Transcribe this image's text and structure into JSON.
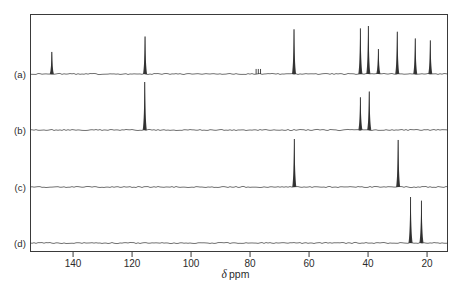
{
  "figure": {
    "type": "nmr-spectra-stack",
    "axis_title_symbol": "δ",
    "axis_title_unit": "ppm",
    "axis": {
      "label": "δ ppm",
      "reversed": true,
      "xlim": [
        154.6,
        12.9
      ],
      "ticks": [
        140,
        120,
        100,
        80,
        60,
        40,
        20
      ],
      "tick_labels": [
        "140",
        "120",
        "100",
        "80",
        "60",
        "40",
        "20"
      ]
    },
    "trace_labels": [
      "(a)",
      "(b)",
      "(c)",
      "(d)"
    ]
  },
  "chart_data": {
    "type": "line",
    "title": "",
    "subtitle": "",
    "xlabel": "δ ppm",
    "ylabel": "",
    "xlim": [
      154.6,
      12.9
    ],
    "ylim": [
      0,
      1
    ],
    "grid": false,
    "legend": "none",
    "axis_reversed": true,
    "x_ticks": [
      140,
      120,
      100,
      80,
      60,
      40,
      20
    ],
    "annotations": [
      "(a)",
      "(b)",
      "(c)",
      "(d)"
    ],
    "series": [
      {
        "name": "(a)",
        "label": "(a)",
        "baseline_ppm_range": [
          154.6,
          12.9
        ],
        "peaks": [
          {
            "ppm": 147.2,
            "intensity": 0.46
          },
          {
            "ppm": 115.6,
            "intensity": 0.78
          },
          {
            "ppm": 77.2,
            "intensity": 0.05
          },
          {
            "ppm": 65.1,
            "intensity": 0.93
          },
          {
            "ppm": 42.6,
            "intensity": 0.95
          },
          {
            "ppm": 39.9,
            "intensity": 1.0
          },
          {
            "ppm": 36.5,
            "intensity": 0.52
          },
          {
            "ppm": 30.1,
            "intensity": 0.88
          },
          {
            "ppm": 24.0,
            "intensity": 0.74
          },
          {
            "ppm": 18.9,
            "intensity": 0.7
          }
        ]
      },
      {
        "name": "(b)",
        "label": "(b)",
        "baseline_ppm_range": [
          154.6,
          12.9
        ],
        "peaks": [
          {
            "ppm": 115.7,
            "intensity": 1.0
          },
          {
            "ppm": 42.6,
            "intensity": 0.68
          },
          {
            "ppm": 39.6,
            "intensity": 0.8
          }
        ]
      },
      {
        "name": "(c)",
        "label": "(c)",
        "baseline_ppm_range": [
          154.6,
          12.9
        ],
        "peaks": [
          {
            "ppm": 65.0,
            "intensity": 1.0
          },
          {
            "ppm": 29.8,
            "intensity": 0.98
          }
        ]
      },
      {
        "name": "(d)",
        "label": "(d)",
        "baseline_ppm_range": [
          154.6,
          12.9
        ],
        "peaks": [
          {
            "ppm": 25.6,
            "intensity": 1.0
          },
          {
            "ppm": 21.9,
            "intensity": 0.92
          }
        ]
      }
    ]
  }
}
